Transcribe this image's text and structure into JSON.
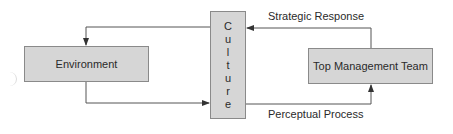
{
  "diagram": {
    "nodes": {
      "environment": "Environment",
      "culture": "Culture",
      "culture_letters": [
        "C",
        "u",
        "l",
        "t",
        "u",
        "r",
        "e"
      ],
      "top_management_team": "Top Management Team"
    },
    "edges": {
      "strategic_response": "Strategic Response",
      "perceptual_process": "Perceptual Process"
    },
    "colors": {
      "box_fill": "#d6d6d6",
      "box_border": "#8a8a8a",
      "line": "#555555"
    }
  }
}
